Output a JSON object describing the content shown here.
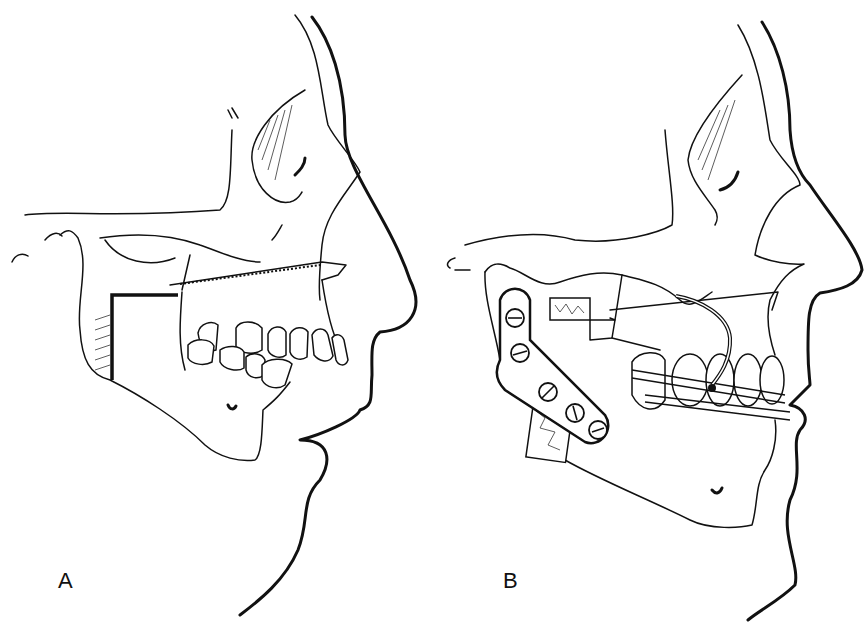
{
  "figure": {
    "panels": [
      {
        "id": "A",
        "label": "A",
        "description": "Lateral profile of face and skull showing planned mandibular osteotomy (step cut in ramus) and maxillary osteotomy line"
      },
      {
        "id": "B",
        "label": "B",
        "description": "Lateral profile after repositioning: bone grafts, L-shaped fixation plate with screws, orthodontic arch wires and suspension wire"
      }
    ],
    "colors": {
      "ink": "#111111",
      "background": "#ffffff"
    }
  }
}
